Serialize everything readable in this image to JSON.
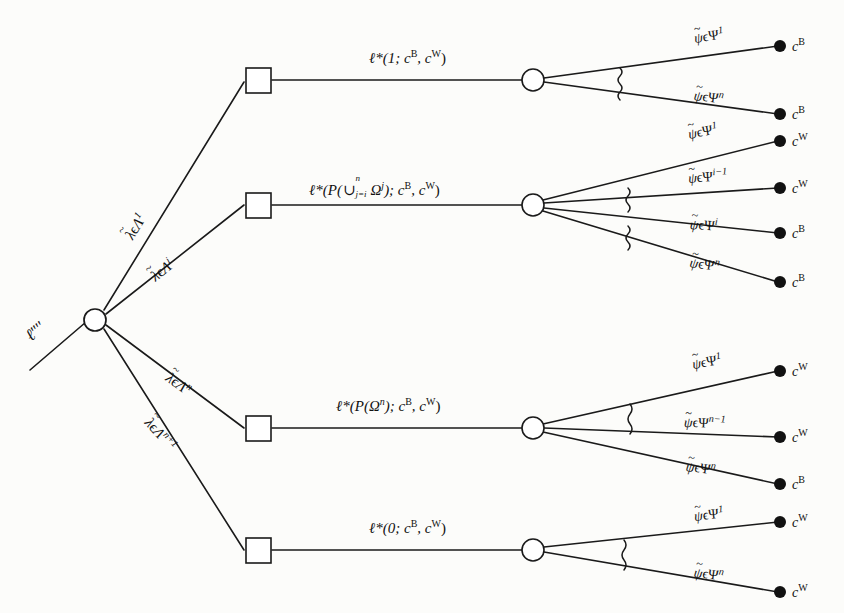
{
  "figure": {
    "type": "decision-tree-diagram",
    "root": {
      "label": "ℓ",
      "primes": "′′′′",
      "node_type": "chance-circle"
    },
    "ink_color": "#1a1a1a",
    "background_color": "#fcfcfa"
  },
  "branches": [
    {
      "id": "branch-1",
      "lambda_label": {
        "base": "λ",
        "accent": "~",
        "set": "Λ",
        "sup": "1",
        "rel": "ϵ"
      },
      "decision_node": "square",
      "ell_label": {
        "text": "ℓ*(1; c",
        "supB": "B",
        "mid": ", c",
        "supW": "W",
        "close": ")"
      },
      "ell_plain": "ℓ*(1; cᴮ, cᵂ)",
      "chance_node": "circle",
      "squiggles": 1,
      "outcomes": [
        {
          "psi_sup": "1",
          "value": "c",
          "value_sup": "B"
        },
        {
          "psi_sup": "n",
          "value": "c",
          "value_sup": "B"
        }
      ]
    },
    {
      "id": "branch-2",
      "lambda_label": {
        "base": "λ",
        "accent": "~",
        "set": "Λ",
        "sup": "i",
        "rel": "ϵ"
      },
      "decision_node": "square",
      "ell_plain": "ℓ*(P(∪ⱼ₌ᵢⁿ Ωʲ); cᴮ, cᵂ)",
      "ell_parts": {
        "head": "ℓ*(P(",
        "union": "∪",
        "union_sup": "n",
        "union_sub": "j=i",
        "omega": "Ω",
        "omega_sup": "j",
        "tail1": "); c",
        "supB": "B",
        "tail2": ", c",
        "supW": "W",
        "close": ")"
      },
      "chance_node": "circle",
      "squiggles": 2,
      "outcomes": [
        {
          "psi_sup": "1",
          "value": "c",
          "value_sup": "W"
        },
        {
          "psi_sup": "i−1",
          "value": "c",
          "value_sup": "W"
        },
        {
          "psi_sup": "i",
          "value": "c",
          "value_sup": "B"
        },
        {
          "psi_sup": "n",
          "value": "c",
          "value_sup": "B"
        }
      ]
    },
    {
      "id": "branch-3",
      "lambda_label": {
        "base": "λ",
        "accent": "~",
        "set": "Λ",
        "sup": "n",
        "rel": "ϵ"
      },
      "decision_node": "square",
      "ell_plain": "ℓ*(P(Ωⁿ); cᴮ, cᵂ)",
      "ell_parts": {
        "head": "ℓ*(P(",
        "omega": "Ω",
        "omega_sup": "n",
        "tail1": "); c",
        "supB": "B",
        "tail2": ", c",
        "supW": "W",
        "close": ")"
      },
      "chance_node": "circle",
      "squiggles": 1,
      "outcomes": [
        {
          "psi_sup": "1",
          "value": "c",
          "value_sup": "W"
        },
        {
          "psi_sup": "n−1",
          "value": "c",
          "value_sup": "W"
        },
        {
          "psi_sup": "n",
          "value": "c",
          "value_sup": "B"
        }
      ]
    },
    {
      "id": "branch-4",
      "lambda_label": {
        "base": "λ",
        "accent": "~",
        "set": "Λ",
        "sup": "n+1",
        "rel": "ϵ"
      },
      "decision_node": "square",
      "ell_plain": "ℓ*(0; cᴮ, cᵂ)",
      "ell_parts": {
        "head": "ℓ*(0; c",
        "supB": "B",
        "tail2": ", c",
        "supW": "W",
        "close": ")"
      },
      "chance_node": "circle",
      "squiggles": 1,
      "outcomes": [
        {
          "psi_sup": "1",
          "value": "c",
          "value_sup": "W"
        },
        {
          "psi_sup": "n",
          "value": "c",
          "value_sup": "W"
        }
      ]
    }
  ],
  "symbols": {
    "psi_base": "ψ",
    "psi_set": "Ψ",
    "epsilon": "ϵ",
    "lambda_base": "λ",
    "lambda_set": "Λ",
    "tilde": "~",
    "star": "*"
  }
}
